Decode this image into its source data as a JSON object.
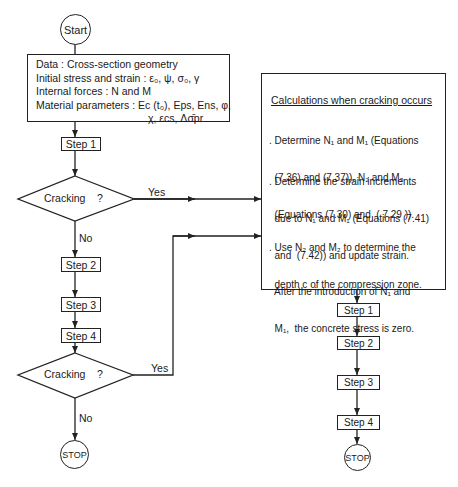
{
  "start": {
    "label": "Start"
  },
  "data_box": {
    "lines": [
      "Data : Cross-section geometry",
      "Initial stress and strain :  ε₀, ψ, σ₀, γ",
      "Internal forces : N and M",
      "Material parameters :  Ec (t₀), Eps, Ens, φ,",
      "χ, εcs, Δσ̄pr"
    ]
  },
  "left_column": {
    "step1": "Step 1",
    "decision1": {
      "label": "Cracking    ?",
      "yes": "Yes",
      "no": "No"
    },
    "step2": "Step 2",
    "step3": "Step 3",
    "step4": "Step 4",
    "decision2": {
      "label": "Cracking    ?",
      "yes": "Yes",
      "no": "No"
    },
    "stop": "STOP"
  },
  "calc_box": {
    "title": "Calculations when cracking occurs",
    "bullets": [
      [
        ". Determine N₁ and M₁ (Equations",
        "  (7.36) and (7.37)), N₂ and M₂",
        "  (Equations (7.30) and  ( 7.29 ))."
      ],
      [
        ". Determine the strain increments",
        "  due to N₁ and M₁ (Equations (7.41)",
        "  and  (7.42)) and update strain.",
        "  After the introduction of N₁ and",
        "  M₁,  the concrete stress is zero."
      ],
      [
        ". Use N₂ and M₂ to determine the",
        "  depth c of the compression zone."
      ]
    ]
  },
  "right_column": {
    "step1": "Step 1",
    "step2": "Step 2",
    "step3": "Step 3",
    "step4": "Step 4",
    "stop": "STOP"
  },
  "colors": {
    "line": "#222222",
    "background": "#ffffff",
    "text": "#1a1a1a"
  }
}
